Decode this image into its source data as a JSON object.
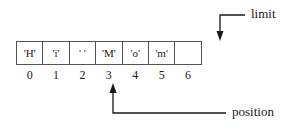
{
  "buffer": {
    "cells": [
      "'H'",
      "'i'",
      "' '",
      "'M'",
      "'o'",
      "'m'",
      ""
    ],
    "indices": [
      "0",
      "1",
      "2",
      "3",
      "4",
      "5",
      "6"
    ]
  },
  "pointers": {
    "limit": {
      "label": "limit",
      "index": 7
    },
    "position": {
      "label": "position",
      "index": 3
    }
  },
  "colors": {
    "line": "#1a1a1a",
    "border": "#555555"
  }
}
